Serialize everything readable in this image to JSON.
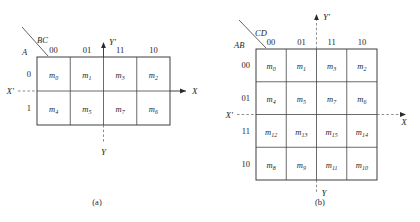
{
  "figure": {
    "caption_a": "(a)",
    "caption_b": "(b)"
  },
  "map_a": {
    "col_group_label": "BC",
    "row_group_label": "A",
    "col_headers": [
      "00",
      "01",
      "11",
      "10"
    ],
    "row_headers": [
      "0",
      "1"
    ],
    "cells": [
      [
        {
          "base": "m",
          "sub": "0"
        },
        {
          "base": "m",
          "sub": "1"
        },
        {
          "base": "m",
          "sub": "3"
        },
        {
          "base": "m",
          "sub": "2"
        }
      ],
      [
        {
          "base": "m",
          "sub": "4"
        },
        {
          "base": "m",
          "sub": "5"
        },
        {
          "base": "m",
          "sub": "7"
        },
        {
          "base": "m",
          "sub": "6"
        }
      ]
    ],
    "axes": {
      "x_positive": "X",
      "x_negative": "X'",
      "y_positive": "Y'",
      "y_negative": "Y"
    }
  },
  "map_b": {
    "col_group_label": "CD",
    "row_group_label": "AB",
    "col_headers": [
      "00",
      "01",
      "11",
      "10"
    ],
    "row_headers": [
      "00",
      "01",
      "11",
      "10"
    ],
    "cells": [
      [
        {
          "base": "m",
          "sub": "0"
        },
        {
          "base": "m",
          "sub": "1"
        },
        {
          "base": "m",
          "sub": "3"
        },
        {
          "base": "m",
          "sub": "2"
        }
      ],
      [
        {
          "base": "m",
          "sub": "4"
        },
        {
          "base": "m",
          "sub": "5"
        },
        {
          "base": "m",
          "sub": "7"
        },
        {
          "base": "m",
          "sub": "6"
        }
      ],
      [
        {
          "base": "m",
          "sub": "12"
        },
        {
          "base": "m",
          "sub": "13"
        },
        {
          "base": "m",
          "sub": "15"
        },
        {
          "base": "m",
          "sub": "14"
        }
      ],
      [
        {
          "base": "m",
          "sub": "8"
        },
        {
          "base": "m",
          "sub": "9"
        },
        {
          "base": "m",
          "sub": "11"
        },
        {
          "base": "m",
          "sub": "10"
        }
      ]
    ],
    "axes": {
      "x_positive": "X",
      "x_negative": "X'",
      "y_positive": "Y'",
      "y_negative": "Y"
    }
  },
  "colors": {
    "ink": "#1f1f1f",
    "rule": "#2b2b2b",
    "dashed": "#6d6d6d",
    "background": "#ffffff"
  }
}
